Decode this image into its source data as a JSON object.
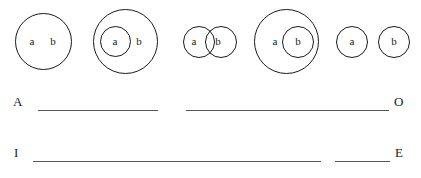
{
  "worksheet": {
    "title": "Euler diagram matching worksheet",
    "term_labels": {
      "subject": "a",
      "predicate": "b"
    }
  },
  "diagrams": [
    {
      "id": "figure-1",
      "name": "single-circle-both-terms",
      "relation": "a and b inside one circle",
      "labels": {
        "a": "a",
        "b": "b"
      }
    },
    {
      "id": "figure-2",
      "name": "a-inside-b",
      "relation": "circle a nested inside circle b",
      "labels": {
        "a": "a",
        "b": "b"
      }
    },
    {
      "id": "figure-3",
      "name": "a-overlaps-b",
      "relation": "circle a partially overlaps circle b",
      "labels": {
        "a": "a",
        "b": "b"
      }
    },
    {
      "id": "figure-4",
      "name": "b-inside-a",
      "relation": "circle b nested inside circle a",
      "labels": {
        "a": "a",
        "b": "b"
      }
    },
    {
      "id": "figure-5",
      "name": "a-disjoint-b",
      "relation": "circle a and circle b separate",
      "labels": {
        "a": "a",
        "b": "b"
      }
    }
  ],
  "answer_rows": [
    {
      "id": "row-ao",
      "left_letter": "A",
      "right_letter": "O",
      "blanks": 2
    },
    {
      "id": "row-ie",
      "left_letter": "I",
      "right_letter": "E",
      "blanks": 2
    }
  ]
}
